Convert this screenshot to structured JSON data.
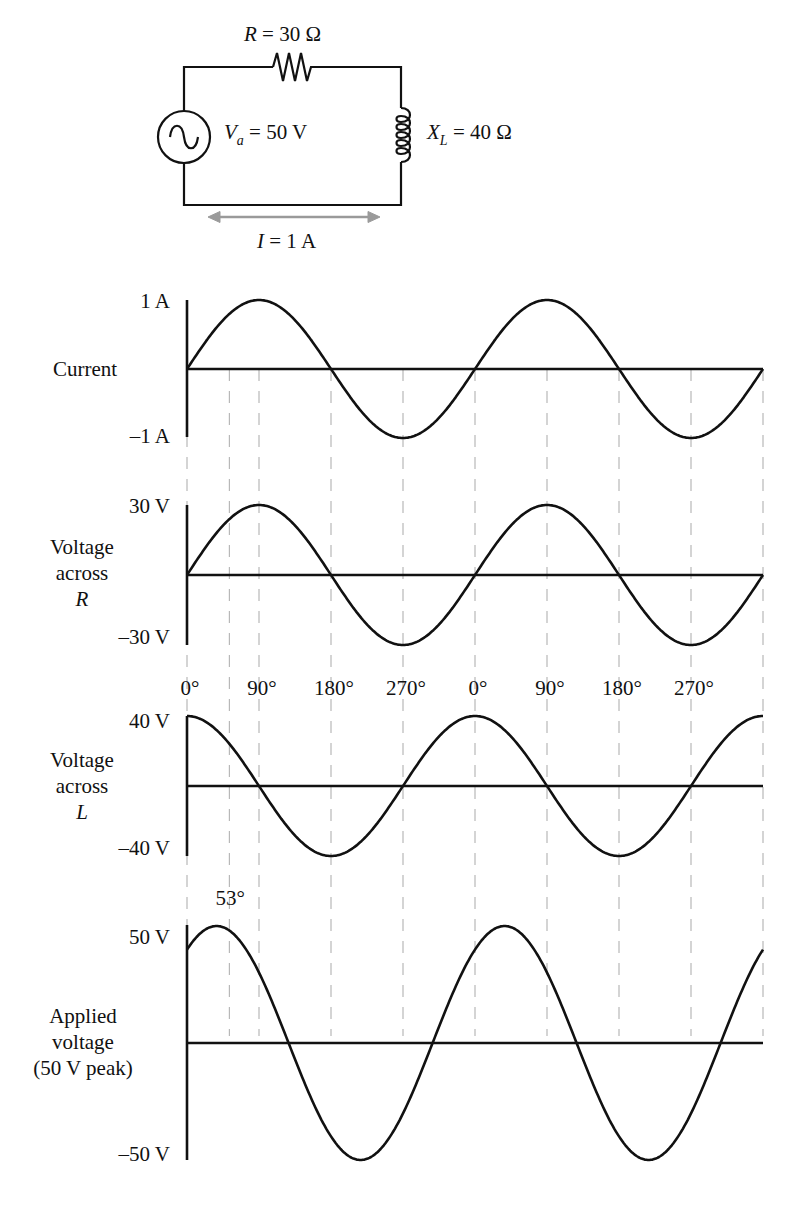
{
  "circuit": {
    "resistor_label": {
      "symbol": "R",
      "value": " = 30 Ω"
    },
    "source_label": {
      "symbol": "V",
      "subscript": "a",
      "value": " = 50 V"
    },
    "inductor_label": {
      "symbol": "X",
      "subscript": "L",
      "value": " = 40 Ω"
    },
    "current_label": {
      "symbol": "I",
      "value": " = 1 A"
    },
    "arrow_color": "#9a9a9a",
    "wire_color": "#111111"
  },
  "degree_axis": {
    "labels": [
      "0°",
      "90°",
      "180°",
      "270°",
      "0°",
      "90°",
      "180°",
      "270°"
    ],
    "degrees": [
      0,
      90,
      180,
      270,
      360,
      450,
      540,
      630
    ]
  },
  "phase_annotation": {
    "label": "53°",
    "degree": 53
  },
  "panels": {
    "current": {
      "label_lines": [
        "Current"
      ],
      "max_label": "1 A",
      "min_label": "–1 A"
    },
    "vr": {
      "label_lines": [
        "Voltage",
        "across"
      ],
      "label_italic_line": "R",
      "max_label": "30 V",
      "min_label": "–30 V"
    },
    "vl": {
      "label_lines": [
        "Voltage",
        "across"
      ],
      "label_italic_line": "L",
      "max_label": "40 V",
      "min_label": "–40 V"
    },
    "va": {
      "label_lines": [
        "Applied",
        "voltage",
        "(50 V peak)"
      ],
      "max_label": "50 V",
      "min_label": "–50 V"
    }
  },
  "grid": {
    "color": "#b8b8b8",
    "degrees": [
      0,
      53,
      90,
      180,
      270,
      360,
      450,
      540,
      630,
      720
    ]
  },
  "chart_data": [
    {
      "type": "line",
      "title": "Current",
      "xlabel": "Phase angle (degrees)",
      "ylabel": "Current (A)",
      "x_range": [
        0,
        720
      ],
      "ylim": [
        -1,
        1
      ],
      "yticks": [
        "1 A",
        "–1 A"
      ],
      "series": [
        {
          "name": "i",
          "function": "1·sin(θ)",
          "amplitude": 1,
          "phase_deg": 0,
          "x": [
            0,
            90,
            180,
            270,
            360,
            450,
            540,
            630,
            720
          ],
          "values": [
            0,
            1,
            0,
            -1,
            0,
            1,
            0,
            -1,
            0
          ]
        }
      ]
    },
    {
      "type": "line",
      "title": "Voltage across R",
      "xlabel": "Phase angle (degrees)",
      "ylabel": "Voltage (V)",
      "x_range": [
        0,
        720
      ],
      "ylim": [
        -30,
        30
      ],
      "yticks": [
        "30 V",
        "–30 V"
      ],
      "series": [
        {
          "name": "v_R",
          "function": "30·sin(θ)",
          "amplitude": 30,
          "phase_deg": 0,
          "x": [
            0,
            90,
            180,
            270,
            360,
            450,
            540,
            630,
            720
          ],
          "values": [
            0,
            30,
            0,
            -30,
            0,
            30,
            0,
            -30,
            0
          ]
        }
      ]
    },
    {
      "type": "line",
      "title": "Voltage across L",
      "xlabel": "Phase angle (degrees)",
      "ylabel": "Voltage (V)",
      "x_range": [
        0,
        720
      ],
      "ylim": [
        -40,
        40
      ],
      "yticks": [
        "40 V",
        "–40 V"
      ],
      "series": [
        {
          "name": "v_L",
          "function": "40·sin(θ+90°)",
          "amplitude": 40,
          "phase_deg": 90,
          "x": [
            0,
            90,
            180,
            270,
            360,
            450,
            540,
            630,
            720
          ],
          "values": [
            40,
            0,
            -40,
            0,
            40,
            0,
            -40,
            0,
            40
          ]
        }
      ]
    },
    {
      "type": "line",
      "title": "Applied voltage (50 V peak)",
      "xlabel": "Phase angle (degrees)",
      "ylabel": "Voltage (V)",
      "x_range": [
        0,
        720
      ],
      "ylim": [
        -50,
        50
      ],
      "yticks": [
        "50 V",
        "–50 V"
      ],
      "annotations": [
        "53°"
      ],
      "series": [
        {
          "name": "v_a",
          "function": "50·sin(θ+53°)",
          "amplitude": 50,
          "phase_deg": 53,
          "x": [
            0,
            37,
            127,
            217,
            307,
            397,
            487,
            577,
            667,
            720
          ],
          "values": [
            40,
            50,
            0,
            -50,
            0,
            50,
            0,
            -50,
            0,
            40
          ]
        }
      ]
    }
  ]
}
